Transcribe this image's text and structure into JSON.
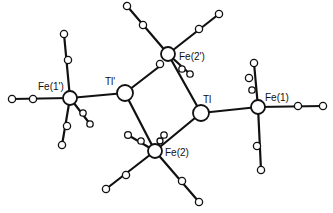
{
  "figure": {
    "type": "ORTEP molecular structure",
    "labels": {
      "fe1p": "Fe(1')",
      "tlp": "Tl'",
      "fe2p": "Fe(2')",
      "tl": "Tl",
      "fe1": "Fe(1)",
      "fe2": "Fe(2)"
    },
    "atoms": [
      {
        "id": "fe1p",
        "label": "Fe(1')",
        "x": 70,
        "y": 98,
        "r": 7
      },
      {
        "id": "tlp",
        "label": "Tl'",
        "x": 125,
        "y": 93,
        "r": 8
      },
      {
        "id": "fe2p",
        "label": "Fe(2')",
        "x": 168,
        "y": 54,
        "r": 7
      },
      {
        "id": "tl",
        "label": "Tl",
        "x": 201,
        "y": 113,
        "r": 8
      },
      {
        "id": "fe1",
        "label": "Fe(1)",
        "x": 258,
        "y": 107,
        "r": 7
      },
      {
        "id": "fe2",
        "label": "Fe(2)",
        "x": 155,
        "y": 151,
        "r": 7
      }
    ]
  }
}
